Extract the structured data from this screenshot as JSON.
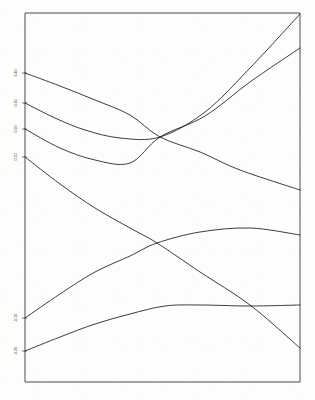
{
  "chart_data": {
    "type": "line",
    "title": "",
    "subtitle": "",
    "xlabel": "",
    "ylabel": "",
    "grid": false,
    "legend": null,
    "legend_position": "none",
    "xlim": [
      0,
      100
    ],
    "ylim": [
      0,
      100
    ],
    "axis_style": "box-frame",
    "x_tick_labels": [],
    "y_tick_labels": [
      "0.40",
      "0.30",
      "0.20",
      "0.10",
      "-0.10",
      "-0.20"
    ],
    "y_tick_positions_px": [
      73,
      103,
      129,
      157,
      318,
      351
    ],
    "note": "Six smooth dispersion-like curves across a plain rectangular frame; y-axis tick labels are tiny and degraded in the scan.",
    "crossing_points": [
      {
        "x_px": 160,
        "y_px": 137,
        "label": "upper band crossing"
      },
      {
        "x_px": 157,
        "y_px": 243,
        "label": "lower band crossing"
      }
    ],
    "series": [
      {
        "name": "band-1",
        "start_px": [
          25,
          73
        ],
        "end_px": [
          300,
          190
        ],
        "shape": "monotonic descending, gentle convex",
        "points_px": [
          [
            25,
            73
          ],
          [
            60,
            86
          ],
          [
            95,
            100
          ],
          [
            130,
            115
          ],
          [
            160,
            137
          ],
          [
            200,
            152
          ],
          [
            240,
            170
          ],
          [
            300,
            190
          ]
        ]
      },
      {
        "name": "band-2",
        "start_px": [
          25,
          103
        ],
        "end_px": [
          300,
          14
        ],
        "shape": "dips to minimum near x=120 then rises steeply to top-right corner",
        "points_px": [
          [
            25,
            103
          ],
          [
            55,
            118
          ],
          [
            85,
            130
          ],
          [
            120,
            138
          ],
          [
            160,
            137
          ],
          [
            205,
            112
          ],
          [
            250,
            68
          ],
          [
            300,
            14
          ]
        ]
      },
      {
        "name": "band-3",
        "start_px": [
          25,
          129
        ],
        "end_px": [
          300,
          48
        ],
        "shape": "shallow minimum near x=135 then rises to upper right",
        "points_px": [
          [
            25,
            129
          ],
          [
            60,
            148
          ],
          [
            95,
            160
          ],
          [
            130,
            163
          ],
          [
            160,
            137
          ],
          [
            205,
            116
          ],
          [
            250,
            82
          ],
          [
            300,
            48
          ]
        ]
      },
      {
        "name": "band-4",
        "start_px": [
          25,
          157
        ],
        "end_px": [
          300,
          235
        ],
        "shape": "broad descending arc through lower crossing",
        "points_px": [
          [
            25,
            157
          ],
          [
            60,
            184
          ],
          [
            95,
            208
          ],
          [
            130,
            228
          ],
          [
            157,
            243
          ],
          [
            200,
            272
          ],
          [
            250,
            305
          ],
          [
            300,
            348
          ]
        ]
      },
      {
        "name": "band-5",
        "start_px": [
          25,
          318
        ],
        "end_px": [
          300,
          235
        ],
        "shape": "ascending, flattening to plateau on the right",
        "points_px": [
          [
            25,
            318
          ],
          [
            60,
            294
          ],
          [
            95,
            272
          ],
          [
            130,
            256
          ],
          [
            157,
            243
          ],
          [
            200,
            232
          ],
          [
            250,
            228
          ],
          [
            300,
            235
          ]
        ]
      },
      {
        "name": "band-6",
        "start_px": [
          25,
          351
        ],
        "end_px": [
          300,
          305
        ],
        "shape": "rises to a broad maximum near x=175 then descends",
        "points_px": [
          [
            25,
            351
          ],
          [
            60,
            337
          ],
          [
            95,
            324
          ],
          [
            130,
            314
          ],
          [
            165,
            306
          ],
          [
            200,
            305
          ],
          [
            250,
            306
          ],
          [
            300,
            305
          ]
        ]
      }
    ]
  },
  "figure": {
    "frame": {
      "left_px": 25,
      "top_px": 13,
      "right_px": 300,
      "bottom_px": 382
    },
    "background_color": "#fdfdfc",
    "curve_color": "#1a1a1a",
    "frame_color": "#4a4a4a"
  }
}
